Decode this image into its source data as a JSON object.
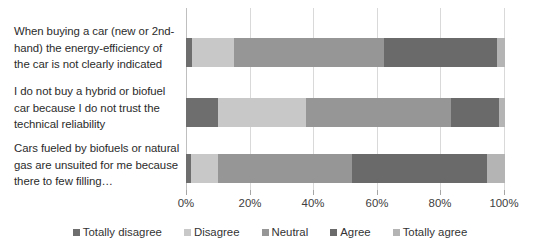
{
  "chart_data": {
    "type": "bar",
    "subtype": "horizontal-stacked-100",
    "title": "",
    "subtitle": "",
    "xlabel": "",
    "ylabel": "",
    "xlim": [
      0,
      100
    ],
    "xtick_labels": [
      "0%",
      "20%",
      "40%",
      "60%",
      "80%",
      "100%"
    ],
    "xtick_values": [
      0,
      20,
      40,
      60,
      80,
      100
    ],
    "grid": true,
    "legend_position": "bottom",
    "categories": [
      "When buying a car (new or 2nd-hand) the energy-efficiency of the car is not clearly indicated",
      "I do not buy a hybrid or biofuel car because I do not trust the technical reliability",
      "Cars fueled by biofuels or natural gas are unsuited for me because there to few filling…"
    ],
    "series": [
      {
        "name": "Totally disagree",
        "color": "#6E6E6E",
        "values": [
          2,
          10,
          1.5
        ]
      },
      {
        "name": "Disagree",
        "color": "#C8C8C8",
        "values": [
          13,
          27.5,
          8.5
        ]
      },
      {
        "name": "Neutral",
        "color": "#969696",
        "values": [
          47,
          45.5,
          42
        ]
      },
      {
        "name": "Agree",
        "color": "#6A6A6A",
        "values": [
          35.5,
          15,
          42.5
        ]
      },
      {
        "name": "Totally agree",
        "color": "#B4B4B4",
        "values": [
          2.5,
          2,
          5.5
        ]
      }
    ]
  },
  "legend": {
    "items": [
      {
        "label": "Totally disagree",
        "color": "#6E6E6E"
      },
      {
        "label": "Disagree",
        "color": "#C8C8C8"
      },
      {
        "label": "Neutral",
        "color": "#969696"
      },
      {
        "label": "Agree",
        "color": "#6A6A6A"
      },
      {
        "label": "Totally agree",
        "color": "#B4B4B4"
      }
    ]
  },
  "axis": {
    "tick_labels": [
      "0%",
      "20%",
      "40%",
      "60%",
      "80%",
      "100%"
    ]
  },
  "category_labels": [
    "When buying a car (new or 2nd-hand) the energy-efficiency of the car is not clearly indicated",
    "I do not buy a hybrid or biofuel car because I do not trust the technical reliability",
    "Cars fueled by biofuels or natural gas are unsuited for me because there to few filling…"
  ]
}
